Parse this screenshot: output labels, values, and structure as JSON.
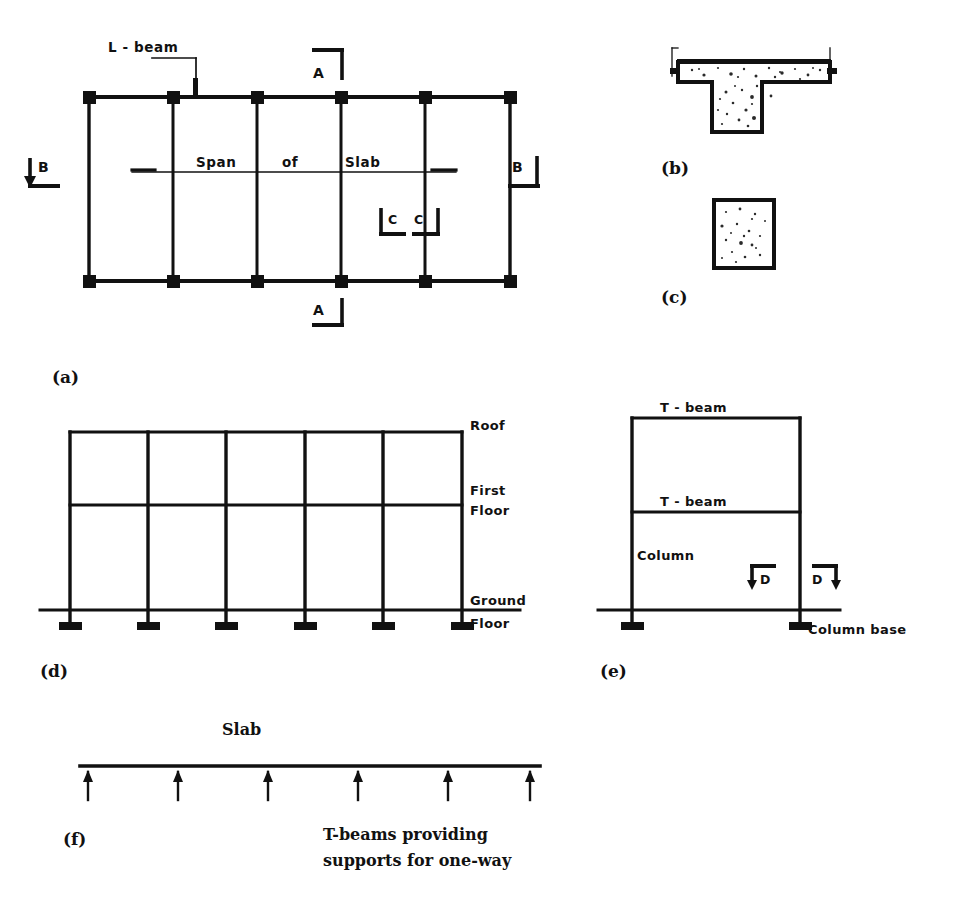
{
  "figure": {
    "ink_color": "#111111",
    "background_color": "#ffffff"
  },
  "panels": {
    "a": {
      "key": "(a)",
      "description": "Structural floor plan grid with columns, L-beams and span of slab",
      "labels": {
        "l_beam": "L - beam",
        "span_word_1": "Span",
        "span_word_2": "of",
        "span_word_3": "Slab"
      },
      "section_markers": {
        "a_top": "A",
        "a_bottom": "A",
        "b_left": "B",
        "b_right": "B",
        "c_left": "C",
        "c_right": "C"
      },
      "grid": {
        "column_count": 6,
        "row_count": 2,
        "left_x": 89,
        "right_x": 510,
        "top_y": 97,
        "bottom_y": 281,
        "column_x": [
          89,
          173,
          257,
          341,
          425,
          510
        ]
      }
    },
    "b": {
      "key": "(b)",
      "description": "T-beam cross-section in concrete (section A-A)"
    },
    "c": {
      "key": "(c)",
      "description": "Square column cross-section in concrete (section C-C)"
    },
    "d": {
      "key": "(d)",
      "description": "Transverse frame elevation showing roof, first floor and ground floor levels",
      "labels": {
        "roof": "Roof",
        "first_floor_line_1": "First",
        "first_floor_line_2": "Floor",
        "ground_floor_line_1": "Ground",
        "ground_floor_line_2": "Floor"
      },
      "geometry": {
        "column_count": 6,
        "left_x": 70,
        "right_x": 462,
        "roof_y": 432,
        "first_floor_y": 505,
        "ground_floor_y": 610,
        "column_x": [
          70,
          148,
          226,
          305,
          383,
          462
        ]
      }
    },
    "e": {
      "key": "(e)",
      "description": "Single bay frame elevation showing T-beams, column and column base",
      "labels": {
        "t_beam_upper": "T - beam",
        "t_beam_lower": "T - beam",
        "column": "Column",
        "column_base": "Column  base"
      },
      "section_markers": {
        "d_left": "D",
        "d_right": "D"
      },
      "geometry": {
        "left_x": 632,
        "right_x": 800,
        "roof_y": 418,
        "mid_beam_y": 512,
        "ground_y": 610
      }
    },
    "f": {
      "key": "(f)",
      "description": "Slab line carried on a series of T-beam supports",
      "labels": {
        "slab": "Slab",
        "caption_line_1": "T-beams providing",
        "caption_line_2": "supports for one-way"
      },
      "geometry": {
        "slab_left_x": 80,
        "slab_right_x": 540,
        "slab_y": 766,
        "support_count": 6,
        "support_x": [
          88,
          178,
          268,
          358,
          448,
          530
        ],
        "support_bottom_y": 800
      }
    }
  }
}
